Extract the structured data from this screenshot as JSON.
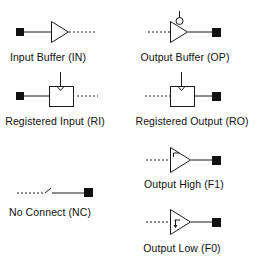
{
  "colors": {
    "stroke": "#1a1a1a",
    "pad": "#111111",
    "background": "#ffffff",
    "text": "#111111"
  },
  "symbols": [
    {
      "id": "input-buffer",
      "label": "Input Buffer (IN)",
      "icon": "input-buffer-icon"
    },
    {
      "id": "output-buffer",
      "label": "Output Buffer (OP)",
      "icon": "output-buffer-icon"
    },
    {
      "id": "registered-input",
      "label": "Registered Input (RI)",
      "icon": "registered-input-icon"
    },
    {
      "id": "registered-output",
      "label": "Registered Output (RO)",
      "icon": "registered-output-icon"
    },
    {
      "id": "output-high",
      "label": "Output High (F1)",
      "icon": "output-high-icon"
    },
    {
      "id": "no-connect",
      "label": "No Connect (NC)",
      "icon": "no-connect-icon"
    },
    {
      "id": "output-low",
      "label": "Output Low (F0)",
      "icon": "output-low-icon"
    }
  ]
}
